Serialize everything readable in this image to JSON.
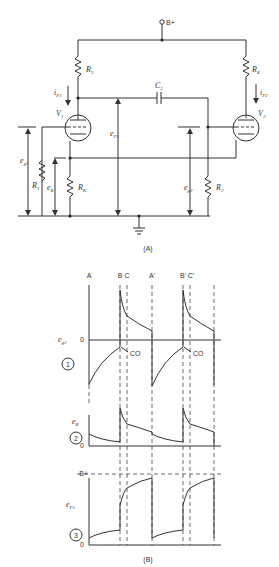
{
  "figure": {
    "part_a": {
      "caption": "(A)",
      "supply_label": "B+",
      "components": {
        "r3": "R",
        "r3_sub": "3",
        "r4": "R",
        "r4_sub": "4",
        "r1": "R",
        "r1_sub": "1",
        "r2": "R",
        "r2_sub": "2",
        "rk": "R",
        "rk_sub": "K",
        "c2": "C",
        "c2_sub": "2",
        "v1": "V",
        "v1_sub": "1",
        "v2": "V",
        "v2_sub": "2"
      },
      "signals": {
        "ip1": "i",
        "ip1_sub": "P1",
        "ip2": "i",
        "ip2_sub": "P2",
        "ep1": "e",
        "ep1_sub": "P1",
        "eg1": "e",
        "eg1_sub": "g1",
        "eg2": "e",
        "eg2_sub": "g2",
        "ek": "e",
        "ek_sub": "K"
      }
    },
    "part_b": {
      "caption": "(B)",
      "time_markers": [
        "A",
        "B",
        "C",
        "A'",
        "B'",
        "C'"
      ],
      "traces": [
        {
          "number": "1",
          "label": "e",
          "label_sub": "g2",
          "zero": "0",
          "annotation": "CO"
        },
        {
          "number": "2",
          "label": "e",
          "label_sub": "K",
          "zero": "0"
        },
        {
          "number": "3",
          "label": "e",
          "label_sub": "P1",
          "zero": "0",
          "ref_level": "B+"
        }
      ],
      "annotation_2": "CO"
    }
  }
}
